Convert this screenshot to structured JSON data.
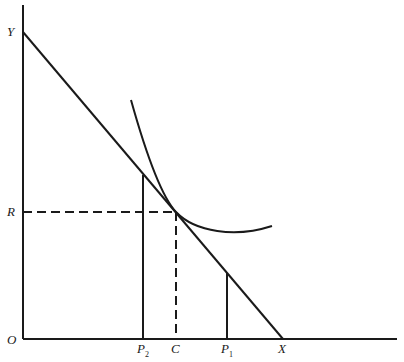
{
  "diagram": {
    "type": "indifference-curve budget-line diagram",
    "axes": {
      "origin_label": "O",
      "y_axis_intercept_label": "Y",
      "x_axis_intercept_label": "X"
    },
    "labels": {
      "y_intercept": "Y",
      "r_level": "R",
      "origin": "O",
      "p2_main": "P",
      "p2_sub": "2",
      "c_point": "C",
      "p1_main": "P",
      "p1_sub": "1",
      "x_intercept": "X"
    },
    "elements": [
      {
        "name": "budget-line",
        "from": "Y",
        "to": "X",
        "style": "solid"
      },
      {
        "name": "indifference-curve",
        "tangent_at": "(C, R)",
        "style": "solid"
      },
      {
        "name": "r-guide",
        "from": "R",
        "to": "tangency",
        "style": "dashed"
      },
      {
        "name": "c-guide",
        "from": "tangency",
        "to": "C",
        "style": "dashed"
      },
      {
        "name": "p2-line",
        "from": "P2",
        "to": "budget-line",
        "style": "solid"
      },
      {
        "name": "p1-line",
        "from": "P1",
        "to": "budget-line",
        "style": "solid"
      }
    ],
    "colors": {
      "ink": "#1a1a1a",
      "background": "#ffffff"
    }
  }
}
